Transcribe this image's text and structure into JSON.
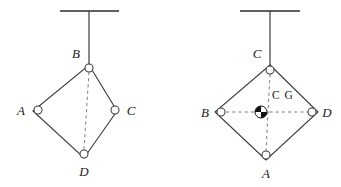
{
  "figure": {
    "type": "engineering-linkage-diagram",
    "background_color": "#ffffff",
    "line_color": "#3a3a3a",
    "dash_color": "#6e6e6e",
    "label_color": "#1a1a1a",
    "cg_marker_color": "#111111",
    "width": 341,
    "height": 187
  },
  "diagrams": [
    {
      "id": "left",
      "name": "left-linkage",
      "support": {
        "ceiling_bar": {
          "x1": 60,
          "y1": 11,
          "x2": 119,
          "y2": 11
        },
        "rod": {
          "x1": 89,
          "y1": 11,
          "x2": 89,
          "y2": 65
        }
      },
      "diamond": {
        "top": {
          "x": 89,
          "y": 65
        },
        "left": {
          "x": 33,
          "y": 111
        },
        "right": {
          "x": 117,
          "y": 111
        },
        "bottom": {
          "x": 84,
          "y": 158
        }
      },
      "joints": [
        {
          "label": "B",
          "name": "joint-b",
          "x": 89,
          "y": 68,
          "label_x": 76,
          "label_y": 58,
          "anchor": "middle"
        },
        {
          "label": "A",
          "name": "joint-a",
          "x": 38,
          "y": 110,
          "label_x": 21,
          "label_y": 115,
          "anchor": "middle"
        },
        {
          "label": "C",
          "name": "joint-c",
          "x": 115,
          "y": 110,
          "label_x": 131,
          "label_y": 115,
          "anchor": "middle"
        },
        {
          "label": "D",
          "name": "joint-d",
          "x": 84,
          "y": 154,
          "label_x": 84,
          "label_y": 176,
          "anchor": "middle"
        }
      ],
      "dashed_lines": [
        {
          "name": "dash-b-to-d",
          "x1": 89,
          "y1": 72,
          "x2": 84,
          "y2": 150
        }
      ],
      "center_of_gravity": null
    },
    {
      "id": "right",
      "name": "right-linkage",
      "support": {
        "ceiling_bar": {
          "x1": 240,
          "y1": 11,
          "x2": 300,
          "y2": 11
        },
        "rod": {
          "x1": 270,
          "y1": 11,
          "x2": 270,
          "y2": 65
        }
      },
      "diamond": {
        "top": {
          "x": 270,
          "y": 65
        },
        "left": {
          "x": 215,
          "y": 112
        },
        "right": {
          "x": 318,
          "y": 112
        },
        "bottom": {
          "x": 266,
          "y": 160
        }
      },
      "joints": [
        {
          "label": "C",
          "name": "joint-c",
          "x": 270,
          "y": 70,
          "label_x": 257,
          "label_y": 58,
          "anchor": "middle"
        },
        {
          "label": "B",
          "name": "joint-b",
          "x": 221,
          "y": 112,
          "label_x": 205,
          "label_y": 117,
          "anchor": "middle"
        },
        {
          "label": "D",
          "name": "joint-d",
          "x": 312,
          "y": 112,
          "label_x": 327,
          "label_y": 117,
          "anchor": "middle"
        },
        {
          "label": "A",
          "name": "joint-a",
          "x": 266,
          "y": 155,
          "label_x": 266,
          "label_y": 178,
          "anchor": "middle"
        }
      ],
      "dashed_lines": [
        {
          "name": "dash-c-to-a",
          "x1": 270,
          "y1": 74,
          "x2": 266,
          "y2": 151
        },
        {
          "name": "dash-b-to-d",
          "x1": 226,
          "y1": 112,
          "x2": 308,
          "y2": 112
        }
      ],
      "center_of_gravity": {
        "name": "center-of-gravity-marker",
        "label": "C G",
        "x": 261,
        "y": 112,
        "radius": 6,
        "label_x": 272,
        "label_y": 99
      }
    }
  ]
}
